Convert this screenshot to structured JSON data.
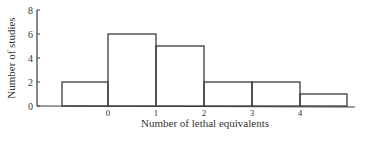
{
  "chart_data": {
    "type": "bar",
    "title": "",
    "xlabel": "Number of lethal equivalents",
    "ylabel": "Number of studies",
    "bins": [
      {
        "from": -1,
        "to": 0,
        "value": 2
      },
      {
        "from": 0,
        "to": 1,
        "value": 6
      },
      {
        "from": 1,
        "to": 2,
        "value": 5
      },
      {
        "from": 2,
        "to": 3,
        "value": 2
      },
      {
        "from": 3,
        "to": 4,
        "value": 2
      },
      {
        "from": 4,
        "to": 5,
        "value": 1
      }
    ],
    "categories": [
      "<0",
      "0-1",
      "1-2",
      "2-3",
      "3-4",
      ">4"
    ],
    "values": [
      2,
      6,
      5,
      2,
      2,
      1
    ],
    "xticks": [
      "0",
      "1",
      "2",
      "3",
      "4"
    ],
    "yticks": [
      "0",
      "2",
      "4",
      "6",
      "8"
    ],
    "ylim": [
      0,
      8
    ],
    "grid": false,
    "legend": null
  },
  "colors": {
    "line": "#3a3a3a",
    "text": "#333333",
    "background": "#ffffff"
  }
}
